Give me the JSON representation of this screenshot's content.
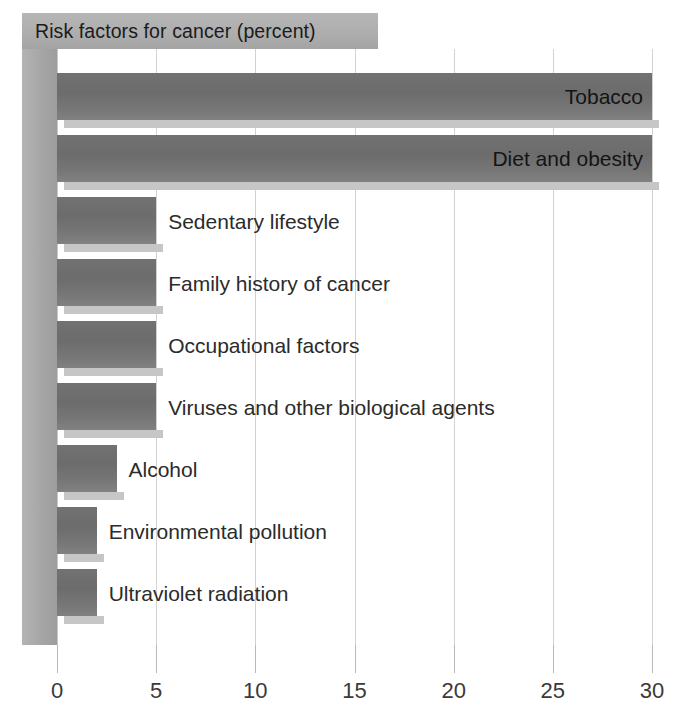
{
  "chart_data": {
    "type": "bar",
    "orientation": "horizontal",
    "title": "Risk factors for cancer (percent)",
    "xlabel": "",
    "ylabel": "",
    "xlim": [
      0,
      30
    ],
    "xticks": [
      0,
      5,
      10,
      15,
      20,
      25,
      30
    ],
    "xtick_labels": [
      "0",
      "5",
      "10",
      "15",
      "20",
      "25",
      "30"
    ],
    "grid": true,
    "legend": false,
    "categories": [
      "Tobacco",
      "Diet and obesity",
      "Sedentary lifestyle",
      "Family history of cancer",
      "Occupational factors",
      "Viruses and other biological agents",
      "Alcohol",
      "Environmental pollution",
      "Ultraviolet radiation"
    ],
    "values": [
      30,
      30,
      5,
      5,
      5,
      5,
      3,
      2,
      2
    ],
    "bars": [
      {
        "label": "Tobacco",
        "value": 30,
        "label_position": "inside"
      },
      {
        "label": "Diet and obesity",
        "value": 30,
        "label_position": "inside"
      },
      {
        "label": "Sedentary lifestyle",
        "value": 5,
        "label_position": "outside"
      },
      {
        "label": "Family history of cancer",
        "value": 5,
        "label_position": "outside"
      },
      {
        "label": "Occupational factors",
        "value": 5,
        "label_position": "outside"
      },
      {
        "label": "Viruses and other biological agents",
        "value": 5,
        "label_position": "outside"
      },
      {
        "label": "Alcohol",
        "value": 3,
        "label_position": "outside"
      },
      {
        "label": "Environmental pollution",
        "value": 2,
        "label_position": "outside"
      },
      {
        "label": "Ultraviolet radiation",
        "value": 2,
        "label_position": "outside"
      }
    ],
    "colors": {
      "bar_fill": "#6e6e6e",
      "bar_shadow": "#c6c6c6",
      "title_band": "#adadad",
      "left_wall": "#a6a6a6",
      "gridline": "#d2d2d2",
      "background": "#ffffff",
      "tick_label": "#3a3a3a"
    }
  }
}
